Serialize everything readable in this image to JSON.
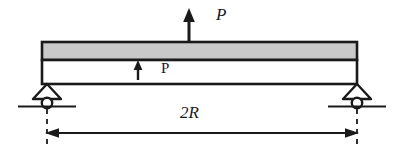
{
  "figure": {
    "labels": {
      "load_top": "P",
      "load_inner": "P",
      "span": "2R"
    },
    "colors": {
      "line": "#1a1a1a",
      "flange_fill": "#c9c9c9",
      "web_fill": "#ffffff",
      "background": "#ffffff"
    },
    "geometry": {
      "beam_left_x": 42,
      "beam_right_x": 357,
      "flange_top_y": 42,
      "flange_bottom_y": 60,
      "web_bottom_y": 84,
      "support_left_x": 47,
      "support_right_x": 357,
      "ground_y": 103,
      "dimension_line_y": 133,
      "top_arrow_x": 189,
      "top_arrow_top_y": 10,
      "inner_arrow_x": 138
    },
    "elements": {
      "beam_flange": "gray-shaded-top-flange",
      "beam_web": "white-web-section",
      "support_left": "roller-support",
      "support_right": "roller-support",
      "load_arrow_top": "upward-point-load-arrow",
      "load_arrow_inner": "upward-internal-force-arrow",
      "dimension": "span-dimension-double-arrow",
      "extension_lines": "dashed-extension-lines"
    }
  }
}
